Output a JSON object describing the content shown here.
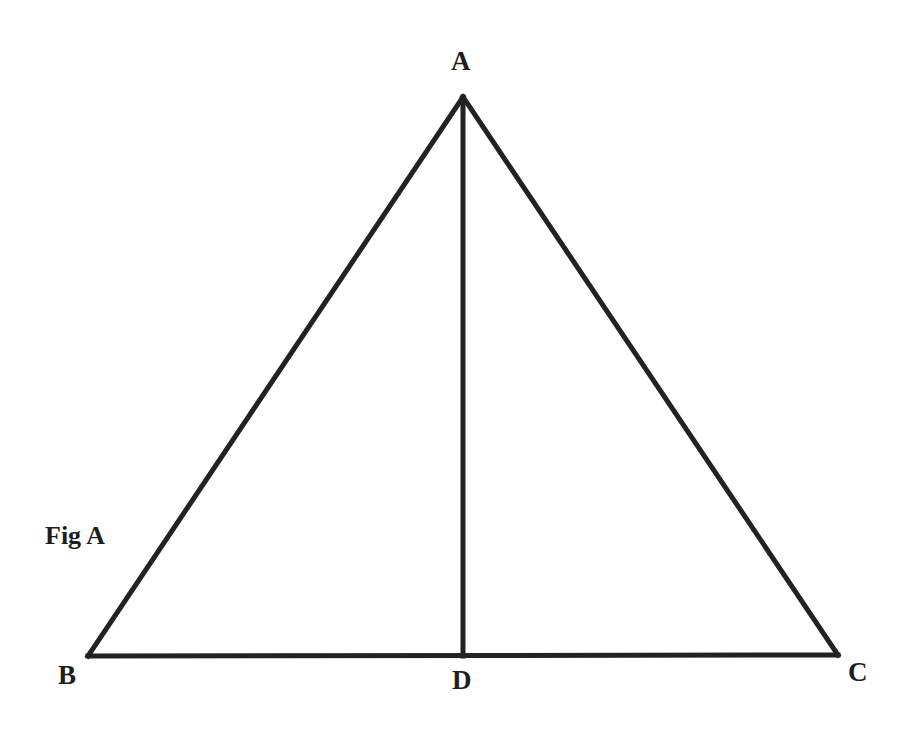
{
  "figure": {
    "caption": "Fig A",
    "stroke_color": "#222222",
    "background": "#ffffff"
  },
  "vertices": {
    "A": {
      "label": "A",
      "x": 463,
      "y": 97
    },
    "B": {
      "label": "B",
      "x": 88,
      "y": 656
    },
    "C": {
      "label": "C",
      "x": 838,
      "y": 655
    },
    "D": {
      "label": "D",
      "x": 463,
      "y": 656
    }
  },
  "segments": [
    {
      "name": "AB",
      "from": "A",
      "to": "B"
    },
    {
      "name": "AC",
      "from": "A",
      "to": "C"
    },
    {
      "name": "BC",
      "from": "B",
      "to": "C"
    },
    {
      "name": "AD",
      "from": "A",
      "to": "D",
      "note": "altitude from A to base BC"
    }
  ]
}
